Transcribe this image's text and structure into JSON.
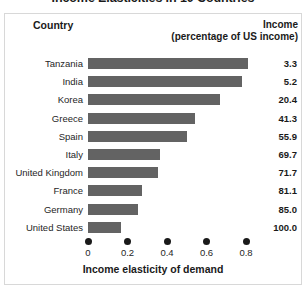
{
  "chart_data": {
    "type": "bar",
    "orientation": "horizontal",
    "title": "Income Elasticities in 10 Countries",
    "xlabel": "Income elasticity of demand",
    "ylabel": "",
    "xlim": [
      0,
      0.9
    ],
    "xticks": [
      "0",
      "0.2",
      "0.4",
      "0.6",
      "0.8"
    ],
    "xtick_values": [
      0,
      0.2,
      0.4,
      0.6,
      0.8
    ],
    "grid": false,
    "legend": "none",
    "bar_color": "#636363",
    "categories": [
      "Tanzania",
      "India",
      "Korea",
      "Greece",
      "Spain",
      "Italy",
      "United Kingdom",
      "France",
      "Germany",
      "United States"
    ],
    "values": [
      0.81,
      0.78,
      0.67,
      0.54,
      0.5,
      0.365,
      0.355,
      0.275,
      0.255,
      0.165
    ],
    "series": [
      {
        "name": "Income elasticity of demand",
        "values": [
          0.81,
          0.78,
          0.67,
          0.54,
          0.5,
          0.365,
          0.355,
          0.275,
          0.255,
          0.165
        ]
      }
    ],
    "annotation_column": {
      "header_line1": "Income",
      "header_line2": "(percentage of US income)",
      "values": [
        "3.3",
        "5.2",
        "20.4",
        "41.3",
        "55.9",
        "69.7",
        "71.7",
        "81.1",
        "85.0",
        "100.0"
      ]
    }
  },
  "table": {
    "header_country": "Country",
    "header_income_line1": "Income",
    "header_income_line2": "(percentage of US income)",
    "rows": [
      {
        "country": "Tanzania",
        "elasticity": 0.81,
        "income": "3.3"
      },
      {
        "country": "India",
        "elasticity": 0.78,
        "income": "5.2"
      },
      {
        "country": "Korea",
        "elasticity": 0.67,
        "income": "20.4"
      },
      {
        "country": "Greece",
        "elasticity": 0.54,
        "income": "41.3"
      },
      {
        "country": "Spain",
        "elasticity": 0.5,
        "income": "55.9"
      },
      {
        "country": "Italy",
        "elasticity": 0.365,
        "income": "69.7"
      },
      {
        "country": "United Kingdom",
        "elasticity": 0.355,
        "income": "71.7"
      },
      {
        "country": "France",
        "elasticity": 0.275,
        "income": "81.1"
      },
      {
        "country": "Germany",
        "elasticity": 0.255,
        "income": "85.0"
      },
      {
        "country": "United States",
        "elasticity": 0.165,
        "income": "100.0"
      }
    ]
  }
}
